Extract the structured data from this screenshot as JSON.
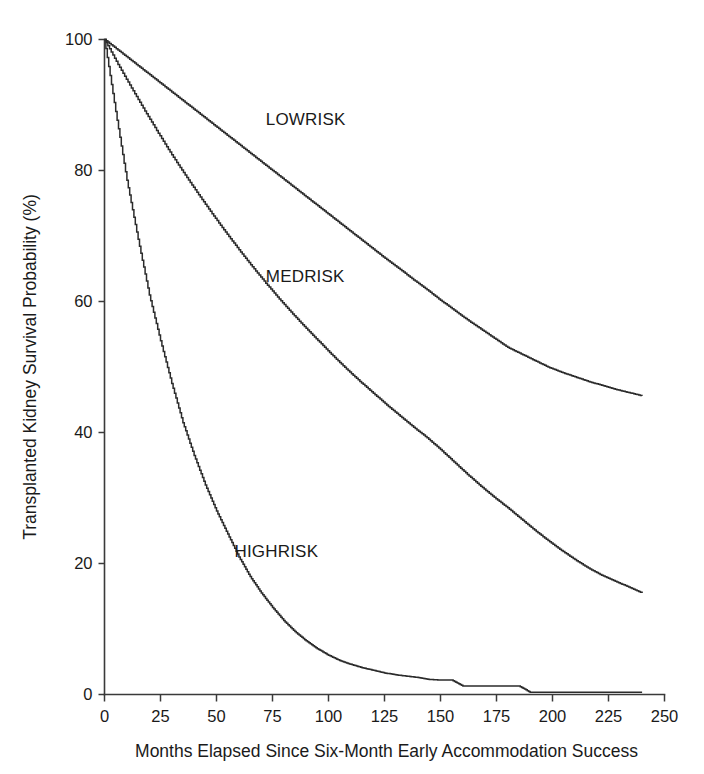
{
  "figure": {
    "background_color": "#ffffff",
    "line_color": "#2b2b2b",
    "axis_color": "#3a3a3a"
  },
  "chart_data": {
    "type": "line",
    "title": "",
    "subtitle": "",
    "xlabel": "Months Elapsed Since Six-Month Early Accommodation Success",
    "ylabel": "Transplanted Kidney Survival Probability (%)",
    "xlim": [
      0,
      250
    ],
    "ylim": [
      0,
      100
    ],
    "xticks": [
      0,
      25,
      50,
      75,
      100,
      125,
      150,
      175,
      200,
      225,
      250
    ],
    "xticklabels": [
      "0",
      "25",
      "50",
      "75",
      "100",
      "125",
      "150",
      "175",
      "200",
      "225",
      "250"
    ],
    "yticks": [
      0,
      20,
      40,
      60,
      80,
      100
    ],
    "yticklabels": [
      "0",
      "20",
      "40",
      "60",
      "80",
      "100"
    ],
    "grid": false,
    "legend_position": "inline-annotation",
    "step_curves": true,
    "annotations": [
      {
        "text": "LOWRISK",
        "x": 72,
        "y": 87
      },
      {
        "text": "MEDRISK",
        "x": 72,
        "y": 63
      },
      {
        "text": "HIGHRISK",
        "x": 58,
        "y": 21
      }
    ],
    "series": [
      {
        "name": "LOWRISK",
        "x": [
          0,
          6,
          12,
          18,
          24,
          30,
          36,
          42,
          48,
          54,
          60,
          66,
          72,
          78,
          84,
          90,
          96,
          102,
          108,
          114,
          120,
          126,
          132,
          138,
          144,
          150,
          156,
          162,
          168,
          174,
          180,
          186,
          192,
          198,
          204,
          210,
          216,
          222,
          228,
          234,
          240
        ],
        "values": [
          100,
          98.4,
          96.8,
          95.2,
          93.6,
          92.0,
          90.4,
          88.8,
          87.2,
          85.6,
          84.0,
          82.4,
          80.8,
          79.2,
          77.6,
          76.0,
          74.4,
          72.8,
          71.2,
          69.6,
          68.0,
          66.4,
          64.9,
          63.3,
          61.8,
          60.2,
          58.7,
          57.2,
          55.8,
          54.4,
          53.0,
          52.0,
          51.0,
          50.0,
          49.2,
          48.5,
          47.8,
          47.2,
          46.6,
          46.1,
          45.6
        ]
      },
      {
        "name": "MEDRISK",
        "x": [
          0,
          6,
          12,
          18,
          24,
          30,
          36,
          42,
          48,
          54,
          60,
          66,
          72,
          78,
          84,
          90,
          96,
          102,
          108,
          114,
          120,
          126,
          132,
          138,
          144,
          150,
          156,
          162,
          168,
          174,
          180,
          186,
          192,
          198,
          204,
          210,
          216,
          222,
          228,
          234,
          240
        ],
        "values": [
          100,
          96.2,
          92.6,
          89.1,
          85.7,
          82.4,
          79.3,
          76.3,
          73.4,
          70.6,
          67.9,
          65.3,
          62.8,
          60.4,
          58.1,
          55.9,
          53.8,
          51.7,
          49.7,
          47.8,
          46.0,
          44.2,
          42.5,
          40.8,
          39.2,
          37.4,
          35.5,
          33.6,
          31.8,
          30.1,
          28.5,
          26.8,
          25.1,
          23.5,
          22.0,
          20.6,
          19.3,
          18.2,
          17.3,
          16.4,
          15.5
        ]
      },
      {
        "name": "HIGHRISK",
        "x": [
          0,
          5,
          10,
          15,
          20,
          25,
          30,
          35,
          40,
          45,
          50,
          55,
          60,
          65,
          70,
          75,
          80,
          85,
          90,
          95,
          100,
          105,
          110,
          115,
          120,
          125,
          130,
          135,
          140,
          145,
          150,
          155,
          160,
          165,
          170,
          175,
          180,
          185,
          190,
          200,
          210,
          220,
          230,
          240
        ],
        "values": [
          100,
          89.0,
          78.5,
          69.5,
          61.0,
          54.0,
          47.5,
          41.5,
          36.5,
          32.0,
          28.0,
          24.5,
          21.0,
          18.0,
          15.5,
          13.3,
          11.3,
          9.6,
          8.2,
          7.0,
          6.0,
          5.2,
          4.6,
          4.1,
          3.7,
          3.3,
          3.0,
          2.8,
          2.6,
          2.3,
          2.2,
          2.2,
          1.3,
          1.3,
          1.3,
          1.3,
          1.3,
          1.3,
          0.35,
          0.35,
          0.35,
          0.35,
          0.35,
          0.35
        ]
      }
    ]
  }
}
